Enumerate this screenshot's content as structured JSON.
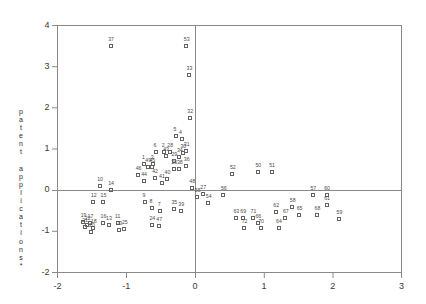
{
  "chart_data": {
    "type": "scatter",
    "title": "",
    "xlabel": "",
    "ylabel": "patent applications*",
    "ylabel_chars": [
      "p",
      "a",
      "t",
      "e",
      "n",
      "t",
      "",
      "a",
      "p",
      "p",
      "l",
      "i",
      "c",
      "a",
      "t",
      "i",
      "o",
      "n",
      "s",
      "*"
    ],
    "xlim": [
      -2,
      3
    ],
    "ylim": [
      -2,
      4
    ],
    "xticks": [
      -2,
      -1,
      0,
      1,
      2,
      3
    ],
    "xticklabels": [
      "-2",
      "-1",
      "0",
      "1",
      "2",
      "3"
    ],
    "yticks": [
      -2,
      -1,
      0,
      1,
      2,
      3,
      4
    ],
    "yticklabels": [
      "-2",
      "-1",
      "0",
      "1",
      "2",
      "3",
      "4"
    ],
    "grid": false,
    "reference_lines": [
      {
        "axis": "vertical",
        "value": 0
      },
      {
        "axis": "horizontal",
        "value": 0
      }
    ],
    "marker": "open-square",
    "marker_color": "#636363",
    "label_color": "#4a4a4a",
    "points": [
      {
        "label": "1",
        "x": -0.73,
        "y": 0.62
      },
      {
        "label": "2",
        "x": -0.44,
        "y": 0.92
      },
      {
        "label": "3",
        "x": -0.6,
        "y": 0.62
      },
      {
        "label": "4",
        "x": -0.19,
        "y": 1.22
      },
      {
        "label": "5",
        "x": -0.27,
        "y": 1.3
      },
      {
        "label": "6",
        "x": -0.56,
        "y": 0.92
      },
      {
        "label": "7",
        "x": -0.5,
        "y": -0.52
      },
      {
        "label": "8",
        "x": -0.62,
        "y": -0.45
      },
      {
        "label": "9",
        "x": -0.72,
        "y": -0.3
      },
      {
        "label": "10",
        "x": -1.38,
        "y": 0.1
      },
      {
        "label": "11",
        "x": -1.12,
        "y": -0.82
      },
      {
        "label": "12",
        "x": -1.47,
        "y": -0.3
      },
      {
        "label": "13",
        "x": -1.25,
        "y": -0.85
      },
      {
        "label": "14",
        "x": -1.22,
        "y": 0.0
      },
      {
        "label": "15",
        "x": -1.33,
        "y": -0.3
      },
      {
        "label": "16",
        "x": -1.33,
        "y": -0.82
      },
      {
        "label": "17",
        "x": -1.52,
        "y": -0.8
      },
      {
        "label": "18",
        "x": -1.47,
        "y": -0.93
      },
      {
        "label": "19",
        "x": -1.62,
        "y": -0.78
      },
      {
        "label": "20",
        "x": -1.5,
        "y": -1.02
      },
      {
        "label": "21",
        "x": -1.6,
        "y": -0.9
      },
      {
        "label": "22",
        "x": -1.56,
        "y": -0.85
      },
      {
        "label": "23",
        "x": -1.1,
        "y": -0.98
      },
      {
        "label": "24",
        "x": -0.62,
        "y": -0.85
      },
      {
        "label": "25",
        "x": -1.02,
        "y": -0.95
      },
      {
        "label": "26",
        "x": -0.3,
        "y": 0.5
      },
      {
        "label": "27",
        "x": 0.12,
        "y": -0.1
      },
      {
        "label": "28",
        "x": -0.36,
        "y": 0.92
      },
      {
        "label": "29",
        "x": -0.3,
        "y": 0.7
      },
      {
        "label": "30",
        "x": -0.17,
        "y": 0.9
      },
      {
        "label": "31",
        "x": -0.12,
        "y": 0.95
      },
      {
        "label": "32",
        "x": -0.07,
        "y": 1.75
      },
      {
        "label": "33",
        "x": -0.08,
        "y": 2.78
      },
      {
        "label": "34",
        "x": -0.22,
        "y": 0.8
      },
      {
        "label": "35",
        "x": -0.3,
        "y": -0.48
      },
      {
        "label": "36",
        "x": -0.12,
        "y": 0.58
      },
      {
        "label": "37",
        "x": -1.22,
        "y": 3.48
      },
      {
        "label": "38",
        "x": -0.22,
        "y": 0.5
      },
      {
        "label": "39",
        "x": -0.2,
        "y": -0.52
      },
      {
        "label": "40",
        "x": -0.4,
        "y": 0.25
      },
      {
        "label": "41",
        "x": -0.48,
        "y": 0.15
      },
      {
        "label": "42",
        "x": -0.58,
        "y": 0.28
      },
      {
        "label": "43",
        "x": -0.42,
        "y": 0.82
      },
      {
        "label": "44",
        "x": -0.74,
        "y": 0.2
      },
      {
        "label": "45",
        "x": -0.62,
        "y": 0.55
      },
      {
        "label": "46",
        "x": -0.82,
        "y": 0.35
      },
      {
        "label": "47",
        "x": -0.52,
        "y": -0.88
      },
      {
        "label": "48",
        "x": -0.04,
        "y": 0.05
      },
      {
        "label": "49",
        "x": -0.68,
        "y": 0.55
      },
      {
        "label": "50",
        "x": 0.92,
        "y": 0.42
      },
      {
        "label": "51",
        "x": 1.12,
        "y": 0.42
      },
      {
        "label": "52",
        "x": 0.55,
        "y": 0.38
      },
      {
        "label": "53",
        "x": -0.12,
        "y": 3.48
      },
      {
        "label": "54",
        "x": 0.2,
        "y": -0.32
      },
      {
        "label": "55",
        "x": 0.04,
        "y": -0.18
      },
      {
        "label": "56",
        "x": 0.42,
        "y": -0.12
      },
      {
        "label": "57",
        "x": 1.72,
        "y": -0.12
      },
      {
        "label": "58",
        "x": 1.42,
        "y": -0.42
      },
      {
        "label": "59",
        "x": 2.1,
        "y": -0.72
      },
      {
        "label": "60",
        "x": 1.92,
        "y": -0.12
      },
      {
        "label": "61",
        "x": 1.92,
        "y": -0.38
      },
      {
        "label": "62",
        "x": 1.18,
        "y": -0.55
      },
      {
        "label": "63",
        "x": 0.6,
        "y": -0.7
      },
      {
        "label": "64",
        "x": 1.22,
        "y": -0.92
      },
      {
        "label": "65",
        "x": 1.52,
        "y": -0.62
      },
      {
        "label": "66",
        "x": 0.92,
        "y": -0.8
      },
      {
        "label": "67",
        "x": 1.32,
        "y": -0.68
      },
      {
        "label": "68",
        "x": 1.78,
        "y": -0.62
      },
      {
        "label": "69",
        "x": 0.7,
        "y": -0.7
      },
      {
        "label": "70",
        "x": 0.96,
        "y": -0.92
      },
      {
        "label": "71",
        "x": 0.85,
        "y": -0.7
      },
      {
        "label": "72",
        "x": 0.72,
        "y": -0.92
      }
    ]
  }
}
